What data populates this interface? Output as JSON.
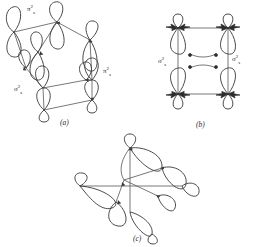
{
  "figure": {
    "background_color": "#ffffff",
    "line_color": "#3a3a3a",
    "panels": [
      {
        "id": "a",
        "caption": "(a)",
        "description": "Skewed parallelepiped arrangement of eight teardrop orbital lobes connected by bonds",
        "labels": [
          {
            "name": "pi-2s-top",
            "text": "π",
            "sup": "2",
            "sub": "s",
            "x": 27,
            "y": 4
          },
          {
            "name": "sigma-2s-left",
            "text": "σ",
            "sup": "2",
            "sub": "s",
            "x": 14,
            "y": 84
          },
          {
            "name": "pi-2s-right",
            "text": "π",
            "sup": "2",
            "sub": "s",
            "x": 103,
            "y": 66
          }
        ]
      },
      {
        "id": "b",
        "caption": "(b)",
        "description": "Symmetric square arrangement of orbital lobes with filled dark lobes at corners",
        "labels": [
          {
            "name": "sigma-2s-left",
            "text": "σ",
            "sup": "2",
            "sub": "s",
            "x": 160,
            "y": 57
          },
          {
            "name": "sigma-2s-right",
            "text": "σ",
            "sup": "2",
            "sub": "s",
            "x": 234,
            "y": 55
          }
        ]
      },
      {
        "id": "c",
        "caption": "(c)",
        "description": "Pinwheel tetrahedral arrangement of orbital lobes about a central axis",
        "labels": []
      }
    ],
    "captions": [
      {
        "name": "caption-a",
        "text": "(a)",
        "x": 60,
        "y": 120
      },
      {
        "name": "caption-b",
        "text": "(b)",
        "x": 196,
        "y": 122
      },
      {
        "name": "caption-c",
        "text": "(c)",
        "x": 133,
        "y": 236
      }
    ]
  }
}
